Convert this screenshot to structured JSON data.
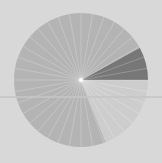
{
  "chart_data": {
    "type": "pie",
    "title": "",
    "labels": [
      "",
      "",
      ""
    ],
    "values": [
      8,
      73,
      19
    ],
    "colors": [
      "#777777",
      "#b4b4b4",
      "#cdcdcd"
    ],
    "start_angle_deg": 0,
    "direction": "counterclockwise",
    "center": [
      81,
      80
    ],
    "radius": 67,
    "spokes": 36,
    "legend": "none",
    "background": "#d8d8d8"
  }
}
